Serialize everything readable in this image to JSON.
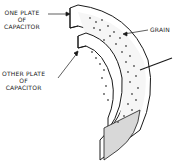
{
  "diagram": {
    "subject": "capacitor",
    "labels": {
      "one_plate": [
        "ONE PLATE",
        "OF",
        "CAPACITOR"
      ],
      "other_plate": [
        "OTHER PLATE",
        "OF",
        "CAPACITOR"
      ],
      "grain": "GRAIN"
    },
    "colors": {
      "line": "#1a1a1a",
      "plate_fill": "#ffffff",
      "grain_dot": "#555555",
      "shade": "#d8d8d8"
    }
  }
}
